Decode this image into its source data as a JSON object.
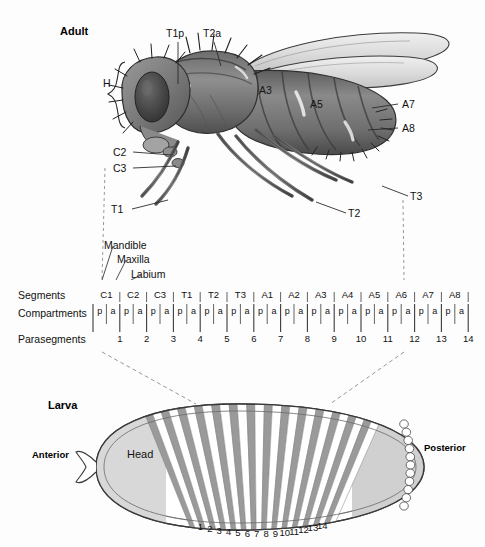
{
  "figure": {
    "adult_label": "Adult",
    "larva_label": "Larva",
    "anterior_label": "Anterior",
    "posterior_label": "Posterior",
    "head_label": "Head"
  },
  "adult_annotations": {
    "head_bracket": "H",
    "thorax": [
      {
        "name": "T1p",
        "x": 169,
        "y": 30
      },
      {
        "name": "T2a",
        "x": 205,
        "y": 30
      }
    ],
    "abdomen_on_body": [
      {
        "name": "A3",
        "x": 262,
        "y": 88
      },
      {
        "name": "A5",
        "x": 313,
        "y": 102
      }
    ],
    "abdomen_leader": [
      {
        "name": "A7",
        "x": 404,
        "y": 103
      },
      {
        "name": "A8",
        "x": 404,
        "y": 127
      }
    ],
    "mouthparts": [
      {
        "name": "C2",
        "x": 116,
        "y": 152
      },
      {
        "name": "C3",
        "x": 116,
        "y": 168
      }
    ],
    "legs": [
      {
        "name": "T1",
        "x": 113,
        "y": 210
      },
      {
        "name": "T2",
        "x": 350,
        "y": 214
      },
      {
        "name": "T3",
        "x": 412,
        "y": 198
      }
    ]
  },
  "mouthpart_callouts": [
    {
      "label": "Mandible",
      "x": 104,
      "y": 244
    },
    {
      "label": "Maxilla",
      "x": 114,
      "y": 258
    },
    {
      "label": "Labium",
      "x": 128,
      "y": 273
    }
  ],
  "map": {
    "row_labels": {
      "segments": "Segments",
      "compartments": "Compartments",
      "parasegments": "Parasegments"
    },
    "segments": [
      "C1",
      "C2",
      "C3",
      "T1",
      "T2",
      "T3",
      "A1",
      "A2",
      "A3",
      "A4",
      "A5",
      "A6",
      "A7",
      "A8"
    ],
    "compartment_posterior": "p",
    "compartment_anterior": "a",
    "compartments_sequence": [
      "p",
      "a",
      "p",
      "a",
      "p",
      "a",
      "p",
      "a",
      "p",
      "a",
      "p",
      "a",
      "p",
      "a",
      "p",
      "a",
      "p",
      "a",
      "p",
      "a",
      "p",
      "a",
      "p",
      "a",
      "p",
      "a",
      "p",
      "a"
    ],
    "parasegments": [
      "1",
      "2",
      "3",
      "4",
      "5",
      "6",
      "7",
      "8",
      "9",
      "10",
      "11",
      "12",
      "13",
      "14"
    ]
  },
  "larva": {
    "parasegment_numbers": [
      "1",
      "2",
      "3",
      "4",
      "5",
      "6",
      "7",
      "8",
      "9",
      "10",
      "11",
      "12",
      "13",
      "14"
    ],
    "stripe_count": 14
  },
  "colors": {
    "stripe_gray": "#9a9a9a",
    "stripe_white": "#ffffff",
    "head_gray": "#d8d8d8",
    "posterior_gray": "#d0d0d0",
    "outline": "#3a3a3a",
    "dashed": "#8c8c8c",
    "text": "#111111",
    "fly_dark": "#4a4a4a",
    "fly_mid": "#7d7d7d",
    "fly_light": "#b5b5b5",
    "wing_fill": "#e3e3e3"
  }
}
